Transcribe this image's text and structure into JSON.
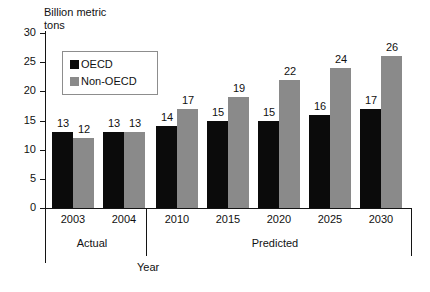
{
  "chart_data": {
    "type": "bar",
    "title": "Billion metric\ntons",
    "xlabel": "Year",
    "ylabel": "Billion metric tons",
    "categories": [
      "2003",
      "2004",
      "2010",
      "2015",
      "2020",
      "2025",
      "2030"
    ],
    "series": [
      {
        "name": "OECD",
        "color": "#0b0b0b",
        "values": [
          13,
          13,
          14,
          15,
          15,
          16,
          17
        ]
      },
      {
        "name": "Non-OECD",
        "color": "#8a8a8a",
        "values": [
          12,
          13,
          17,
          19,
          22,
          24,
          26
        ]
      }
    ],
    "ylim": [
      0,
      30
    ],
    "ytick_labels": [
      "0",
      "5",
      "10",
      "15",
      "20",
      "25",
      "30"
    ],
    "yticks": [
      0,
      5,
      10,
      15,
      20,
      25,
      30
    ],
    "grid": false,
    "legend_position": "upper-left-inside",
    "group_labels": [
      {
        "label": "Actual",
        "categories": [
          "2003",
          "2004"
        ]
      },
      {
        "label": "Predicted",
        "categories": [
          "2010",
          "2015",
          "2020",
          "2025",
          "2030"
        ]
      }
    ],
    "annotations": [
      "Bar value labels printed above every bar",
      "Vertical rule separates Actual from Predicted sections"
    ]
  },
  "legend": {
    "items": [
      {
        "label": "OECD",
        "swatch": "black-square-swatch"
      },
      {
        "label": "Non-OECD",
        "swatch": "gray-square-swatch"
      }
    ]
  }
}
